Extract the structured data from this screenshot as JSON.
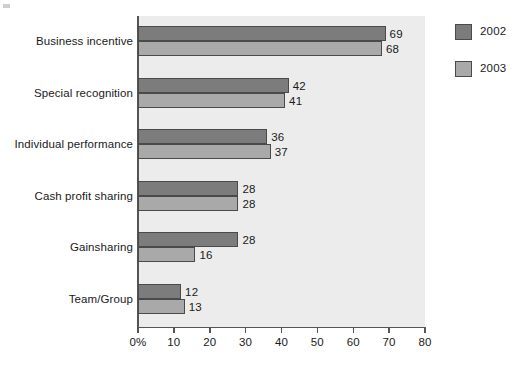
{
  "chart_data": {
    "type": "bar",
    "orientation": "horizontal",
    "title": "",
    "xlabel": "",
    "ylabel": "",
    "xlim": [
      0,
      80
    ],
    "grid": false,
    "legend_position": "right",
    "categories": [
      "Business incentive",
      "Special recognition",
      "Individual performance",
      "Cash profit sharing",
      "Gainsharing",
      "Team/Group"
    ],
    "x_tick_labels": [
      "0%",
      "10",
      "20",
      "30",
      "40",
      "50",
      "60",
      "70",
      "80"
    ],
    "x_tick_values": [
      0,
      10,
      20,
      30,
      40,
      50,
      60,
      70,
      80
    ],
    "series": [
      {
        "name": "2002",
        "color": "#7c7c7c",
        "values": [
          69,
          42,
          36,
          28,
          28,
          12
        ],
        "value_labels": [
          "69",
          "42",
          "36",
          "28",
          "28",
          "12"
        ]
      },
      {
        "name": "2003",
        "color": "#a9a9a9",
        "values": [
          68,
          41,
          37,
          28,
          16,
          13
        ],
        "value_labels": [
          "68",
          "41",
          "37",
          "28",
          "16",
          "13"
        ]
      }
    ]
  },
  "legend": {
    "items": [
      {
        "label": "2002",
        "color": "#7c7c7c"
      },
      {
        "label": "2003",
        "color": "#a9a9a9"
      }
    ]
  },
  "colors": {
    "plot_background": "#ececec",
    "page_background": "#ffffff",
    "axis": "#555555",
    "text": "#1a1a1a",
    "series_2002": "#7c7c7c",
    "series_2003": "#a9a9a9"
  }
}
